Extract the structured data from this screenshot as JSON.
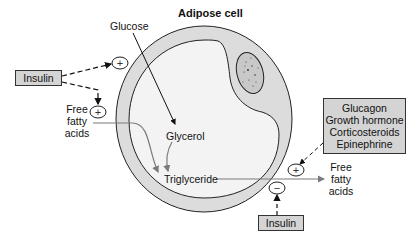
{
  "title": "Adipose cell",
  "labels": {
    "glucose": "Glucose",
    "glycerol": "Glycerol",
    "triglyceride": "Triglyceride",
    "ffa_in": [
      "Free",
      "fatty",
      "acids"
    ],
    "ffa_out": [
      "Free",
      "fatty",
      "acids"
    ]
  },
  "boxes": {
    "insulin_top": "Insulin",
    "insulin_bottom": "Insulin",
    "hormones": [
      "Glucagon",
      "Growth hormone",
      "Corticosteroids",
      "Epinephrine"
    ]
  },
  "signs": {
    "glucose_uptake": "+",
    "ffa_uptake": "+",
    "lipolysis_stimulation": "+",
    "lipolysis_inhibition": "−"
  },
  "colors": {
    "membrane_fill": "#dcdcdc",
    "cytoplasm_fill": "#f2f2f2",
    "box_fill": "#d4d4d4",
    "flow_arrow": "#7a7a7a",
    "stroke": "#222222"
  }
}
